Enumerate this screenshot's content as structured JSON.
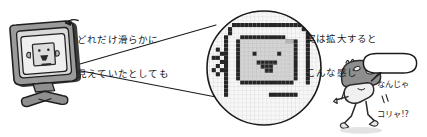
{
  "page": {
    "background_color": "#ffffff",
    "ink_color": "#1a1a1a",
    "width": 427,
    "height": 137,
    "kind": "hand-drawn-illustration"
  },
  "annotations": {
    "left_callout": {
      "line1": "どれだけ滑らかに",
      "line2": "見えていたとしても",
      "arrow": "arrow-left"
    },
    "right_callout": {
      "line1": "実は拡大すると",
      "line2": "こんな感じ"
    },
    "speech_bubble": {
      "line1": "なんじゃ",
      "line2": "コリャ!?"
    }
  },
  "monitor": {
    "label": "crt-monitor",
    "bezel_color": "#9a9a9a",
    "bezel_shadow": "#3d3d3d",
    "screen_color": "#efefef",
    "face": {
      "label": "smiling-face-on-screen",
      "fill": "#d8d8d8",
      "outline": "#2a2a2a"
    },
    "stand_color": "#8f8f8f"
  },
  "magnifier": {
    "label": "magnified-pixel-circle",
    "outline_color": "#1a1a1a",
    "grid_color": "#c8c8c8",
    "grid_cells_x": 34,
    "grid_cells_y": 34,
    "pixel_dark": "#232323",
    "pixel_mid": "#c9c9c9",
    "pixel_light": "#f2f2f2",
    "cone_color": "#1a1a1a"
  },
  "character": {
    "label": "mushroom-character",
    "cap_color": "#8e8e8e",
    "body_color": "#f0f0f0",
    "outline_color": "#2a2a2a",
    "motion_marks": "motion-lines"
  },
  "colors": {
    "ink": "#1a1a1a",
    "grey_dark": "#3d3d3d",
    "grey_mid": "#9a9a9a",
    "grey_light": "#d8d8d8",
    "paper": "#ffffff"
  }
}
